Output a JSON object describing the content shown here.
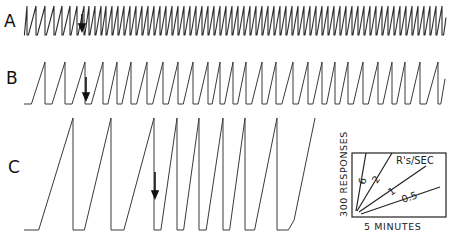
{
  "chart_data": {
    "type": "line",
    "title": "",
    "panels": [
      {
        "label": "A",
        "baseline_y": 35,
        "top_y": 6,
        "start_x": 24,
        "end_x": 446,
        "arrow_x": 82,
        "resets_x": [
          27,
          36,
          45,
          54,
          62,
          70,
          77,
          84,
          89,
          95,
          101,
          106,
          112,
          118,
          124,
          130,
          136,
          142,
          148,
          154,
          160,
          166,
          172,
          178,
          184,
          190,
          196,
          202,
          208,
          214,
          220,
          226,
          232,
          238,
          244,
          250,
          256,
          262,
          268,
          274,
          280,
          286,
          292,
          298,
          304,
          310,
          316,
          322,
          328,
          334,
          340,
          346,
          352,
          358,
          364,
          370,
          376,
          382,
          388,
          394,
          400,
          406,
          412,
          418,
          424,
          430,
          436,
          442
        ]
      },
      {
        "label": "B",
        "baseline_y": 104,
        "top_y": 62,
        "start_x": 24,
        "end_x": 445,
        "arrow_x": 86,
        "resets_x": [
          45,
          65,
          85,
          103,
          117,
          131,
          147,
          163,
          178,
          193,
          208,
          220,
          233,
          246,
          262,
          276,
          293,
          308,
          322,
          335,
          348,
          363,
          378,
          392,
          405,
          420,
          438
        ]
      },
      {
        "label": "C",
        "baseline_y": 230,
        "top_y": 118,
        "start_x": 24,
        "end_x": 315,
        "arrow_x": 155,
        "resets_x": [
          73,
          111,
          154,
          177,
          199,
          223,
          245,
          277
        ],
        "final_top_x": 315
      }
    ],
    "key": {
      "ylabel": "300 RESPONSES",
      "xlabel": "5 MINUTES",
      "series_title": "R's/SEC",
      "rates": [
        {
          "label": "6",
          "value": 6
        },
        {
          "label": "2",
          "value": 2
        },
        {
          "label": "1",
          "value": 1
        },
        {
          "label": "0.5",
          "value": 0.5
        }
      ]
    }
  },
  "labels": {
    "panel_a": "A",
    "panel_b": "B",
    "panel_c": "C",
    "key_ylabel": "300 RESPONSES",
    "key_xlabel": "5 MINUTES",
    "key_title": "R's/SEC",
    "rate_6": "6",
    "rate_2": "2",
    "rate_1": "1",
    "rate_05": "0.5"
  }
}
